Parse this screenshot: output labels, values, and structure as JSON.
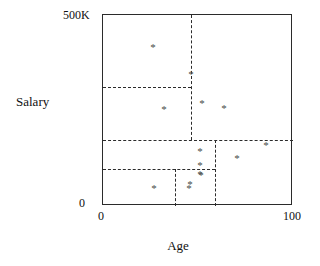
{
  "chart_data": {
    "type": "scatter",
    "title": "",
    "xlabel": "Age",
    "ylabel": "Salary",
    "xlim": [
      0,
      100
    ],
    "ylim": [
      0,
      500
    ],
    "xtick_labels": [
      "0",
      "100"
    ],
    "ytick_labels": [
      "0",
      "500K"
    ],
    "y_unit": "K",
    "grid": false,
    "legend": null,
    "point_marker": "*",
    "point_color": "#4a4a4a",
    "axis_color": "#2b2b2b",
    "split_color": "#2b2b2b",
    "points": [
      {
        "id": "p1",
        "age": 26,
        "salary": 415,
        "x_px": 152,
        "y_px": 46
      },
      {
        "id": "p2",
        "age": 46,
        "salary": 345,
        "x_px": 190,
        "y_px": 73
      },
      {
        "id": "p3",
        "age": 32,
        "salary": 255,
        "x_px": 163,
        "y_px": 108
      },
      {
        "id": "p4",
        "age": 52,
        "salary": 270,
        "x_px": 201,
        "y_px": 102
      },
      {
        "id": "p5",
        "age": 64,
        "salary": 256,
        "x_px": 223,
        "y_px": 107
      },
      {
        "id": "p6",
        "age": 51,
        "salary": 145,
        "x_px": 199,
        "y_px": 150
      },
      {
        "id": "p7",
        "age": 51,
        "salary": 108,
        "x_px": 199,
        "y_px": 164
      },
      {
        "id": "p8",
        "age": 51,
        "salary": 85,
        "x_px": 199,
        "y_px": 173
      },
      {
        "id": "p9",
        "age": 46,
        "salary": 58,
        "x_px": 189,
        "y_px": 183
      },
      {
        "id": "p10",
        "age": 71,
        "salary": 126,
        "x_px": 236,
        "y_px": 157
      },
      {
        "id": "p11",
        "age": 86,
        "salary": 160,
        "x_px": 265,
        "y_px": 144
      },
      {
        "id": "p12",
        "age": 27,
        "salary": 48,
        "x_px": 153,
        "y_px": 187
      },
      {
        "id": "p13",
        "age": 45,
        "salary": 48,
        "x_px": 188,
        "y_px": 187
      },
      {
        "id": "p14",
        "age": 52,
        "salary": 82,
        "x_px": 200,
        "y_px": 174
      }
    ],
    "splits": [
      {
        "id": "s1",
        "orientation": "vertical",
        "value_age": 46,
        "x_px": 88,
        "y0_px": 0,
        "y1_px": 125
      },
      {
        "id": "s2",
        "orientation": "horizontal",
        "value_salary": 312,
        "y_px": 72,
        "x0_px": 0,
        "x1_px": 88
      },
      {
        "id": "s3",
        "orientation": "horizontal",
        "value_salary": 173,
        "y_px": 125,
        "x0_px": 0,
        "x1_px": 190
      },
      {
        "id": "s4",
        "orientation": "vertical",
        "value_age": 59,
        "x_px": 112,
        "y0_px": 125,
        "y1_px": 191
      },
      {
        "id": "s5",
        "orientation": "horizontal",
        "value_salary": 97,
        "y_px": 154,
        "x0_px": 0,
        "x1_px": 112
      },
      {
        "id": "s6",
        "orientation": "vertical",
        "value_age": 38,
        "x_px": 72,
        "y0_px": 154,
        "y1_px": 191
      }
    ]
  },
  "axes": {
    "y_max_label": "500K",
    "y_min_label": "0",
    "x_min_label": "0",
    "x_max_label": "100",
    "y_title": "Salary",
    "x_title": "Age"
  }
}
